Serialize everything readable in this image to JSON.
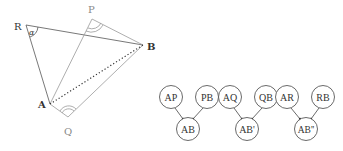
{
  "geometry": {
    "points": [
      {
        "id": "R",
        "label": "R",
        "x": 26,
        "y": 25,
        "lx": 14,
        "ly": 30,
        "grey": false
      },
      {
        "id": "P",
        "label": "P",
        "x": 92,
        "y": 19,
        "lx": 88,
        "ly": 13,
        "grey": true
      },
      {
        "id": "B",
        "label": "B",
        "x": 143,
        "y": 45,
        "lx": 147,
        "ly": 50,
        "grey": false
      },
      {
        "id": "A",
        "label": "A",
        "x": 50,
        "y": 104,
        "lx": 38,
        "ly": 108,
        "grey": false
      },
      {
        "id": "Q",
        "label": "Q",
        "x": 68,
        "y": 117,
        "lx": 64,
        "ly": 135,
        "grey": true
      }
    ],
    "angle_label": "α",
    "angle_markers": [
      {
        "vertex": "R",
        "type": "single"
      },
      {
        "vertex": "P",
        "type": "double"
      },
      {
        "vertex": "Q",
        "type": "double"
      }
    ],
    "segments": [
      {
        "from": "R",
        "to": "B",
        "style": "solid",
        "color": "#555"
      },
      {
        "from": "R",
        "to": "A",
        "style": "solid",
        "color": "#555"
      },
      {
        "from": "P",
        "to": "B",
        "style": "solid",
        "color": "#999"
      },
      {
        "from": "P",
        "to": "A",
        "style": "solid",
        "color": "#999"
      },
      {
        "from": "Q",
        "to": "B",
        "style": "solid",
        "color": "#999"
      },
      {
        "from": "Q",
        "to": "A",
        "style": "solid",
        "color": "#999"
      },
      {
        "from": "A",
        "to": "B",
        "style": "dotted",
        "color": "#333"
      }
    ]
  },
  "trees": [
    {
      "left": "AP",
      "right": "PB",
      "result": "AB"
    },
    {
      "left": "AQ",
      "right": "QB",
      "result": "AB'"
    },
    {
      "left": "AR",
      "right": "RB",
      "result": "AB''"
    }
  ]
}
